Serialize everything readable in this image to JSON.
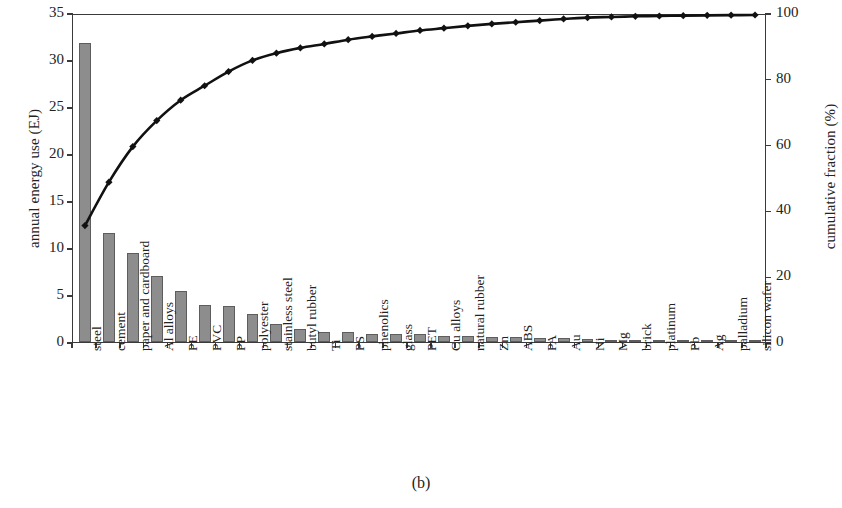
{
  "caption": "(b)",
  "axes": {
    "y_left_title": "annual energy use (EJ)",
    "y_right_title": "cumulative fraction (%)",
    "y_left_ticks": [
      "0",
      "5",
      "10",
      "15",
      "20",
      "25",
      "30",
      "35"
    ],
    "y_right_ticks": [
      "0",
      "20",
      "40",
      "60",
      "80",
      "100"
    ]
  },
  "style": {
    "bar_fill": "#8d8d8d",
    "bar_stroke": "#5d5d5d",
    "line_color": "#111111",
    "marker_color": "#111111",
    "frame_color": "#3a3a3a",
    "background": "#ffffff"
  },
  "chart_data": {
    "type": "bar",
    "title": "",
    "subtitle": "",
    "xlabel": "",
    "ylabel": "annual energy use (EJ)",
    "y2label": "cumulative fraction (%)",
    "ylim": [
      0,
      35
    ],
    "y2lim": [
      0,
      100
    ],
    "yticks": [
      0,
      5,
      10,
      15,
      20,
      25,
      30,
      35
    ],
    "y2ticks": [
      0,
      20,
      40,
      60,
      80,
      100
    ],
    "grid": false,
    "legend": null,
    "annotations": [
      "(b)"
    ],
    "categories": [
      "steel",
      "cement",
      "paper and cardboard",
      "Al alloys",
      "PE",
      "PVC",
      "PP",
      "polyester",
      "stainless steel",
      "butyl rubber",
      "Ti",
      "PS",
      "phenolics",
      "glass",
      "PET",
      "Cu alloys",
      "natural rubber",
      "Zn",
      "ABS",
      "PA",
      "Au",
      "Ni",
      "Mg",
      "brick",
      "platinum",
      "Pb",
      "Ag",
      "palladium",
      "silicon wafer"
    ],
    "series": [
      {
        "name": "annual energy use (EJ)",
        "type": "bar",
        "axis": "left",
        "values": [
          31.8,
          11.6,
          9.5,
          7.0,
          5.4,
          3.9,
          3.8,
          3.0,
          1.9,
          1.4,
          1.1,
          1.1,
          0.9,
          0.85,
          0.8,
          0.6,
          0.6,
          0.5,
          0.5,
          0.45,
          0.4,
          0.35,
          0.2,
          0.2,
          0.2,
          0.2,
          0.15,
          0.15,
          0.1
        ]
      },
      {
        "name": "cumulative fraction (%)",
        "type": "line",
        "axis": "right",
        "marker": "diamond",
        "values": [
          36.0,
          49.2,
          60.0,
          67.9,
          74.1,
          78.5,
          82.8,
          86.2,
          88.4,
          90.0,
          91.2,
          92.5,
          93.5,
          94.4,
          95.3,
          96.0,
          96.7,
          97.3,
          97.8,
          98.3,
          98.8,
          99.2,
          99.4,
          99.6,
          99.7,
          99.8,
          99.9,
          99.95,
          100.0
        ]
      }
    ]
  }
}
